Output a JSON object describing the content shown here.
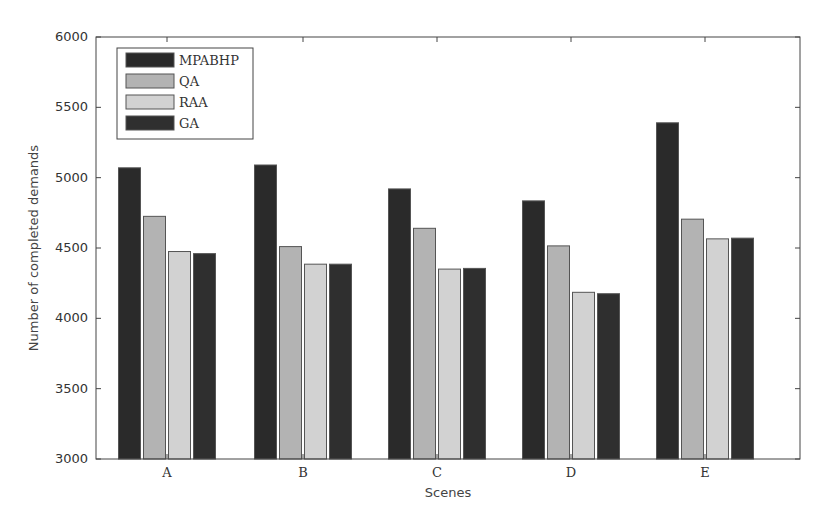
{
  "chart_data": {
    "type": "bar",
    "title": "",
    "xlabel": "Scenes",
    "ylabel": "Number of completed demands",
    "ylim": [
      3000,
      6000
    ],
    "yticks": [
      3000,
      3500,
      4000,
      4500,
      5000,
      5500,
      6000
    ],
    "grid": false,
    "legend_position": "upper-left",
    "categories": [
      "A",
      "B",
      "C",
      "D",
      "E"
    ],
    "series": [
      {
        "name": "MPABHP",
        "color": "#2a2a2a",
        "values": [
          5070,
          5090,
          4920,
          4835,
          5390
        ]
      },
      {
        "name": "QA",
        "color": "#b3b3b3",
        "values": [
          4725,
          4510,
          4640,
          4515,
          4705
        ]
      },
      {
        "name": "RAA",
        "color": "#d2d2d2",
        "values": [
          4475,
          4385,
          4350,
          4185,
          4565
        ]
      },
      {
        "name": "GA",
        "color": "#2f2f2f",
        "values": [
          4460,
          4385,
          4355,
          4175,
          4570
        ]
      }
    ]
  }
}
